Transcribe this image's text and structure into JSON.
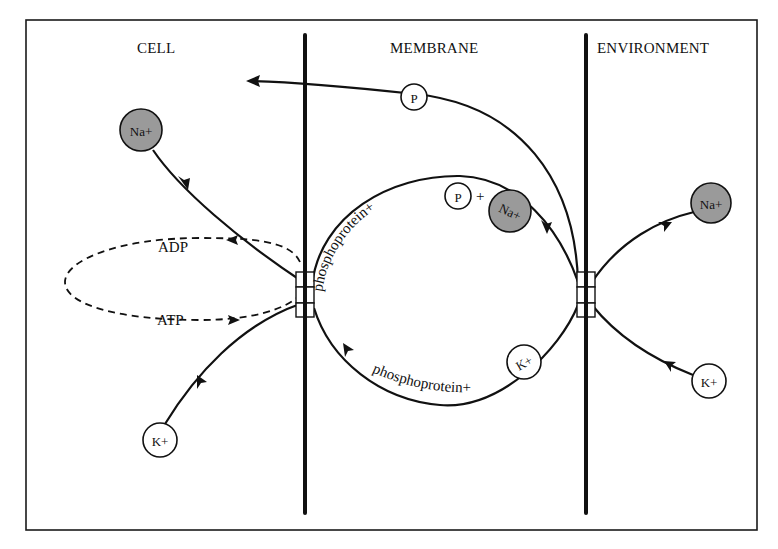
{
  "regions": {
    "cell": "CELL",
    "membrane": "MEMBRANE",
    "environment": "ENVIRONMENT"
  },
  "ions": {
    "na_cell": "Na+",
    "na_membrane": "Na+",
    "na_environment": "Na+",
    "k_cell": "K+",
    "k_membrane": "K+",
    "k_environment": "K+"
  },
  "phosphate": {
    "top": "P",
    "upper_arc": "P"
  },
  "nucleotides": {
    "adp": "ADP",
    "atp": "ATP"
  },
  "arcs": {
    "upper_label": "phosphoprotein+",
    "upper_plus": "+",
    "lower_label": "phosphoprotein+"
  },
  "colors": {
    "sodium_fill": "#9a9a9a",
    "potassium_fill": "#ffffff",
    "line": "#111111"
  }
}
